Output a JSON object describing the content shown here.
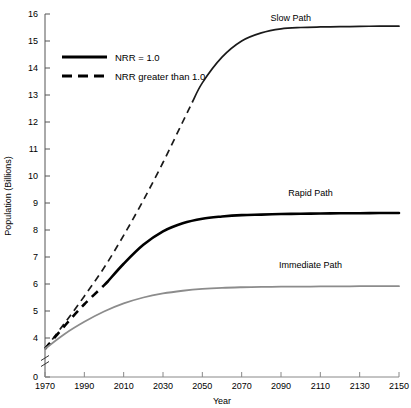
{
  "chart_data": {
    "type": "line",
    "title": "",
    "xlabel": "Year",
    "ylabel": "Population (Billions)",
    "xlim": [
      1970,
      2150
    ],
    "ylim": [
      0,
      16
    ],
    "y_axis_break": true,
    "y_axis_break_range": [
      0,
      3.2
    ],
    "grid": false,
    "legend_position": "upper-left-inside",
    "xticks": [
      "1970",
      "1990",
      "2010",
      "2030",
      "2050",
      "2070",
      "2090",
      "2110",
      "2130",
      "2150"
    ],
    "xtick_values": [
      1970,
      1990,
      2010,
      2030,
      2050,
      2070,
      2090,
      2110,
      2130,
      2150
    ],
    "yticks": [
      "0",
      "4",
      "5",
      "6",
      "7",
      "8",
      "9",
      "10",
      "11",
      "12",
      "13",
      "14",
      "15",
      "16"
    ],
    "ytick_values": [
      0,
      4,
      5,
      6,
      7,
      8,
      9,
      10,
      11,
      12,
      13,
      14,
      15,
      16
    ],
    "legend": [
      {
        "label": "NRR = 1.0",
        "style": "solid",
        "color": "#000000"
      },
      {
        "label": "NRR greater than 1.0",
        "style": "dashed",
        "color": "#000000"
      }
    ],
    "annotations": [
      {
        "text": "Slow Path",
        "x": 2095,
        "y": 15.75
      },
      {
        "text": "Rapid Path",
        "x": 2105,
        "y": 9.25
      },
      {
        "text": "Immediate Path",
        "x": 2105,
        "y": 6.6
      }
    ],
    "series": [
      {
        "name": "Slow Path",
        "color": "#1a1a1a",
        "width": 1.7,
        "dash_until": 2045,
        "x": [
          1970,
          1980,
          1990,
          2000,
          2010,
          2020,
          2030,
          2040,
          2045,
          2050,
          2060,
          2070,
          2080,
          2090,
          2100,
          2110,
          2120,
          2130,
          2140,
          2150
        ],
        "values": [
          3.6,
          4.55,
          5.55,
          6.6,
          7.8,
          9.1,
          10.5,
          12.0,
          12.75,
          13.45,
          14.4,
          15.0,
          15.3,
          15.45,
          15.5,
          15.52,
          15.53,
          15.54,
          15.55,
          15.55
        ]
      },
      {
        "name": "Rapid Path",
        "color": "#000000",
        "width": 2.6,
        "dash_until": 2002,
        "x": [
          1970,
          1980,
          1990,
          2000,
          2002,
          2010,
          2020,
          2030,
          2040,
          2050,
          2060,
          2070,
          2080,
          2090,
          2100,
          2110,
          2120,
          2130,
          2140,
          2150
        ],
        "values": [
          3.6,
          4.45,
          5.25,
          5.95,
          6.1,
          6.75,
          7.45,
          7.95,
          8.25,
          8.42,
          8.5,
          8.55,
          8.57,
          8.59,
          8.6,
          8.61,
          8.62,
          8.62,
          8.63,
          8.63
        ]
      },
      {
        "name": "Immediate Path",
        "color": "#8c8c8c",
        "width": 1.8,
        "dash_until": null,
        "x": [
          1970,
          1980,
          1990,
          2000,
          2010,
          2020,
          2030,
          2040,
          2050,
          2060,
          2070,
          2080,
          2090,
          2100,
          2110,
          2120,
          2130,
          2140,
          2150
        ],
        "values": [
          3.6,
          4.15,
          4.6,
          4.98,
          5.28,
          5.5,
          5.65,
          5.75,
          5.82,
          5.86,
          5.88,
          5.89,
          5.9,
          5.9,
          5.91,
          5.91,
          5.92,
          5.92,
          5.92
        ]
      }
    ]
  }
}
